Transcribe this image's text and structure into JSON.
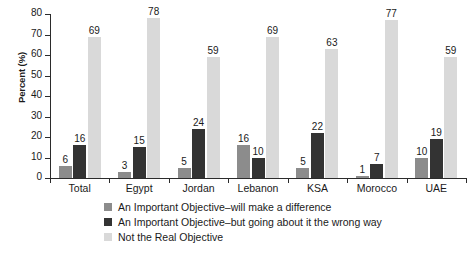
{
  "chart_data": {
    "type": "bar",
    "title": "",
    "subtitle": "",
    "xlabel": "",
    "ylabel": "Percent (%)",
    "ylim": [
      0,
      80
    ],
    "ytick_labels": [
      "0",
      "10",
      "20",
      "30",
      "40",
      "50",
      "60",
      "70",
      "80"
    ],
    "ytick_values": [
      0,
      10,
      20,
      30,
      40,
      50,
      60,
      70,
      80
    ],
    "grid": false,
    "legend_position": "bottom",
    "categories": [
      "Total",
      "Egypt",
      "Jordan",
      "Lebanon",
      "KSA",
      "Morocco",
      "UAE"
    ],
    "series": [
      {
        "name": "An Important Objective–will make a difference",
        "color": "#8c8c8c",
        "values": [
          6,
          3,
          5,
          16,
          5,
          1,
          10
        ]
      },
      {
        "name": "An Important Objective–but going about it the wrong way",
        "color": "#333333",
        "values": [
          16,
          15,
          24,
          10,
          22,
          7,
          19
        ]
      },
      {
        "name": "Not the Real Objective",
        "color": "#d9d9d9",
        "values": [
          69,
          78,
          59,
          69,
          63,
          77,
          59
        ]
      }
    ],
    "data_labels": {
      "Total": [
        "6",
        "16",
        "69"
      ],
      "Egypt": [
        "3",
        "15",
        "78"
      ],
      "Jordan": [
        "5",
        "24",
        "59"
      ],
      "Lebanon": [
        "16",
        "10",
        "69"
      ],
      "KSA": [
        "5",
        "22",
        "63"
      ],
      "Morocco": [
        "1",
        "7",
        "77"
      ],
      "UAE": [
        "10",
        "19",
        "59"
      ]
    }
  },
  "axis": {
    "y_title": "Percent (%)"
  },
  "legend": {
    "items": [
      {
        "label": "An Important Objective–will make a difference",
        "color": "#8c8c8c"
      },
      {
        "label": "An Important Objective–but going about it the wrong way",
        "color": "#333333"
      },
      {
        "label": "Not the Real Objective",
        "color": "#d9d9d9"
      }
    ]
  }
}
